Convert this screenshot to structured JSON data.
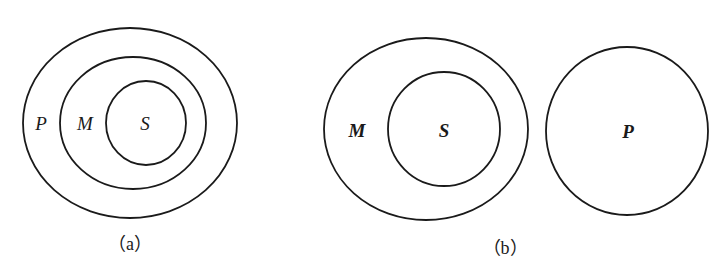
{
  "diagram_a": {
    "caption": "（a）",
    "sets": [
      {
        "label": "P",
        "cx": 130,
        "cy": 123,
        "rx": 107,
        "ry": 95,
        "label_x": 41,
        "label_y": 130
      },
      {
        "label": "M",
        "cx": 133,
        "cy": 123,
        "rx": 73,
        "ry": 66,
        "label_x": 85,
        "label_y": 130
      },
      {
        "label": "S",
        "cx": 146,
        "cy": 123,
        "rx": 40,
        "ry": 42,
        "label_x": 145,
        "label_y": 130
      }
    ]
  },
  "diagram_b": {
    "caption": "（b）",
    "sets": [
      {
        "label": "M",
        "cx": 426,
        "cy": 129,
        "rx": 102,
        "ry": 91,
        "label_x": 357,
        "label_y": 137
      },
      {
        "label": "S",
        "cx": 444,
        "cy": 129,
        "rx": 56,
        "ry": 57,
        "label_x": 444,
        "label_y": 137
      },
      {
        "label": "P",
        "cx": 627,
        "cy": 131,
        "rx": 81,
        "ry": 84,
        "label_x": 628,
        "label_y": 138
      }
    ]
  }
}
